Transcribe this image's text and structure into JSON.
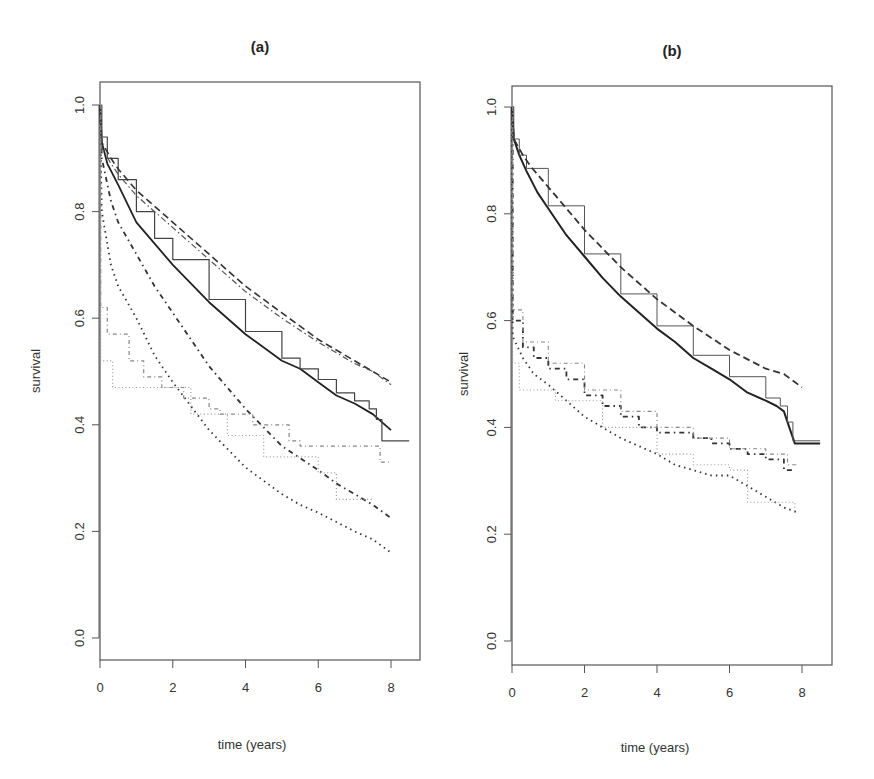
{
  "figure": {
    "panels": [
      {
        "id": "a",
        "title": "(a)",
        "xlabel": "time (years)",
        "ylabel": "survival"
      },
      {
        "id": "b",
        "title": "(b)",
        "xlabel": "time (years)",
        "ylabel": "survival"
      }
    ]
  },
  "chart_data": [
    {
      "type": "line",
      "title": "(a)",
      "xlabel": "time (years)",
      "ylabel": "survival",
      "xlim": [
        0,
        8.5
      ],
      "ylim": [
        0,
        1.0
      ],
      "xticks": [
        0,
        2,
        4,
        6,
        8
      ],
      "yticks": [
        0.0,
        0.2,
        0.4,
        0.6,
        0.8,
        1.0
      ],
      "ytick_labels": [
        "0.0",
        "0.2",
        "0.4",
        "0.6",
        "0.8",
        "1.0"
      ],
      "grid": false,
      "legend": null,
      "series": [
        {
          "name": "solid-1",
          "style": "solid",
          "color": "#222222",
          "width": 1.8,
          "x": [
            0,
            0.05,
            0.2,
            0.5,
            1,
            1.5,
            2,
            3,
            4,
            5,
            5.5,
            6,
            6.5,
            7,
            7.5,
            8
          ],
          "y": [
            1.0,
            0.93,
            0.89,
            0.85,
            0.78,
            0.74,
            0.7,
            0.63,
            0.57,
            0.52,
            0.505,
            0.48,
            0.455,
            0.44,
            0.42,
            0.39
          ]
        },
        {
          "name": "solid-2",
          "style": "solid",
          "color": "#444444",
          "width": 1.2,
          "step": true,
          "x": [
            0,
            0.05,
            0.2,
            0.5,
            1,
            1.5,
            2,
            3,
            4,
            5,
            5.5,
            6,
            6.5,
            7,
            7.4,
            7.6,
            7.75,
            8.5
          ],
          "y": [
            1.0,
            0.94,
            0.9,
            0.86,
            0.8,
            0.75,
            0.71,
            0.635,
            0.575,
            0.525,
            0.505,
            0.485,
            0.46,
            0.445,
            0.43,
            0.41,
            0.37,
            0.37
          ]
        },
        {
          "name": "dashed-1",
          "style": "dashed",
          "color": "#333333",
          "width": 1.6,
          "x": [
            0,
            0.05,
            0.3,
            0.5,
            1,
            2,
            3,
            4,
            5,
            6,
            7,
            7.5,
            8
          ],
          "y": [
            1.0,
            0.93,
            0.9,
            0.88,
            0.84,
            0.78,
            0.72,
            0.66,
            0.61,
            0.56,
            0.52,
            0.5,
            0.48
          ]
        },
        {
          "name": "dashed-2",
          "style": "dotdash",
          "color": "#555555",
          "width": 1.2,
          "x": [
            0,
            0.05,
            0.3,
            0.5,
            1,
            2,
            3,
            4,
            5,
            6,
            7,
            7.5,
            8
          ],
          "y": [
            1.0,
            0.92,
            0.89,
            0.87,
            0.83,
            0.77,
            0.71,
            0.65,
            0.6,
            0.555,
            0.515,
            0.5,
            0.475
          ]
        },
        {
          "name": "dotdash-heavy",
          "style": "longdash-dot",
          "color": "#333333",
          "width": 1.8,
          "x": [
            0,
            0.05,
            0.3,
            0.5,
            1,
            1.5,
            2,
            3,
            4,
            5,
            6,
            6.5,
            7,
            7.5,
            8
          ],
          "y": [
            1.0,
            0.9,
            0.82,
            0.78,
            0.72,
            0.66,
            0.61,
            0.51,
            0.43,
            0.36,
            0.315,
            0.29,
            0.27,
            0.25,
            0.225
          ]
        },
        {
          "name": "dotted",
          "style": "dotted",
          "color": "#333333",
          "width": 1.8,
          "x": [
            0,
            0.05,
            0.3,
            0.5,
            1,
            1.5,
            2,
            3,
            4,
            5,
            5.5,
            6,
            7,
            7.5,
            8
          ],
          "y": [
            1.0,
            0.8,
            0.7,
            0.66,
            0.6,
            0.53,
            0.48,
            0.39,
            0.32,
            0.27,
            0.25,
            0.235,
            0.2,
            0.185,
            0.16
          ]
        },
        {
          "name": "grey-step-dashdot",
          "style": "dashdot-step",
          "color": "#888888",
          "width": 1.2,
          "step": true,
          "x": [
            0,
            0.02,
            0.2,
            0.8,
            1.2,
            1.7,
            2.3,
            3.0,
            3.3,
            4.2,
            4.5,
            5.2,
            5.5,
            7.6,
            7.7,
            8.0
          ],
          "y": [
            1.0,
            0.62,
            0.57,
            0.52,
            0.49,
            0.47,
            0.45,
            0.43,
            0.42,
            0.4,
            0.4,
            0.37,
            0.36,
            0.36,
            0.33,
            0.33
          ]
        },
        {
          "name": "grey-step-dotted",
          "style": "dotted-step",
          "color": "#999999",
          "width": 1.2,
          "step": true,
          "x": [
            0,
            0.02,
            0.15,
            0.35,
            2.0,
            2.5,
            3.5,
            4.5,
            6.0,
            6.5,
            7.3,
            7.5
          ],
          "y": [
            1.0,
            0.52,
            0.52,
            0.47,
            0.47,
            0.42,
            0.38,
            0.34,
            0.31,
            0.26,
            0.26,
            0.26
          ]
        }
      ]
    },
    {
      "type": "line",
      "title": "(b)",
      "xlabel": "time (years)",
      "ylabel": "survival",
      "xlim": [
        0,
        8.5
      ],
      "ylim": [
        0,
        1.0
      ],
      "xticks": [
        0,
        2,
        4,
        6,
        8
      ],
      "yticks": [
        0.0,
        0.2,
        0.4,
        0.6,
        0.8,
        1.0
      ],
      "ytick_labels": [
        "0.0",
        "0.2",
        "0.4",
        "0.6",
        "0.8",
        "1.0"
      ],
      "grid": false,
      "legend": null,
      "series": [
        {
          "name": "solid-1",
          "style": "solid",
          "color": "#222222",
          "width": 2.0,
          "x": [
            0,
            0.05,
            0.2,
            0.4,
            0.7,
            1,
            1.5,
            2,
            2.5,
            3,
            3.5,
            4,
            4.5,
            5,
            5.5,
            6,
            6.5,
            7,
            7.3,
            7.5,
            7.65,
            7.8,
            8.5
          ],
          "y": [
            1.0,
            0.94,
            0.91,
            0.88,
            0.84,
            0.81,
            0.76,
            0.72,
            0.68,
            0.645,
            0.615,
            0.585,
            0.56,
            0.53,
            0.51,
            0.49,
            0.465,
            0.45,
            0.44,
            0.43,
            0.4,
            0.37,
            0.37
          ]
        },
        {
          "name": "solid-2",
          "style": "solid",
          "color": "#555555",
          "width": 1.0,
          "step": true,
          "x": [
            0,
            0.05,
            0.2,
            0.4,
            1,
            2,
            3,
            4,
            5,
            6,
            7,
            7.4,
            7.6,
            7.75,
            8.5
          ],
          "y": [
            1.0,
            0.94,
            0.91,
            0.885,
            0.815,
            0.725,
            0.65,
            0.59,
            0.535,
            0.495,
            0.455,
            0.44,
            0.41,
            0.375,
            0.375
          ]
        },
        {
          "name": "dashed-1",
          "style": "dashed",
          "color": "#333333",
          "width": 1.8,
          "x": [
            0,
            0.05,
            0.3,
            0.5,
            1,
            2,
            3,
            4,
            5,
            6,
            7,
            7.5,
            8
          ],
          "y": [
            1.0,
            0.94,
            0.91,
            0.89,
            0.85,
            0.77,
            0.7,
            0.64,
            0.59,
            0.545,
            0.51,
            0.5,
            0.475
          ]
        },
        {
          "name": "dotdash-step",
          "style": "longdash-dot",
          "color": "#333333",
          "width": 1.8,
          "step": true,
          "x": [
            0,
            0.02,
            0.3,
            0.6,
            1.0,
            1.5,
            2.0,
            2.5,
            3.0,
            3.5,
            4.0,
            5.0,
            5.5,
            6.0,
            6.5,
            7.0,
            7.5,
            7.8
          ],
          "y": [
            1.0,
            0.6,
            0.55,
            0.53,
            0.51,
            0.49,
            0.46,
            0.44,
            0.42,
            0.4,
            0.39,
            0.38,
            0.37,
            0.36,
            0.35,
            0.34,
            0.32,
            0.32
          ]
        },
        {
          "name": "dotted",
          "style": "dotted",
          "color": "#333333",
          "width": 1.8,
          "x": [
            0,
            0.02,
            0.3,
            0.6,
            1.0,
            1.5,
            2.0,
            2.5,
            3.0,
            4.0,
            4.5,
            5.5,
            6.0,
            6.5,
            7.0,
            7.5,
            7.9
          ],
          "y": [
            1.0,
            0.57,
            0.53,
            0.5,
            0.48,
            0.45,
            0.42,
            0.4,
            0.38,
            0.35,
            0.33,
            0.31,
            0.31,
            0.29,
            0.27,
            0.25,
            0.24
          ]
        },
        {
          "name": "grey-step-dashdot",
          "style": "dashdot-step",
          "color": "#888888",
          "width": 1.1,
          "step": true,
          "x": [
            0,
            0.02,
            0.3,
            1.0,
            2.0,
            3.0,
            4.0,
            5.0,
            6.0,
            7.0,
            7.6,
            7.9
          ],
          "y": [
            1.0,
            0.62,
            0.56,
            0.52,
            0.47,
            0.43,
            0.4,
            0.38,
            0.36,
            0.35,
            0.33,
            0.33
          ]
        },
        {
          "name": "grey-step-dotted",
          "style": "dotted-step",
          "color": "#999999",
          "width": 1.1,
          "step": true,
          "x": [
            0,
            0.02,
            0.2,
            1.2,
            2.5,
            4.0,
            5.0,
            6.0,
            6.5,
            7.5,
            7.8
          ],
          "y": [
            1.0,
            0.52,
            0.47,
            0.45,
            0.4,
            0.35,
            0.33,
            0.32,
            0.26,
            0.26,
            0.24
          ]
        }
      ]
    }
  ]
}
